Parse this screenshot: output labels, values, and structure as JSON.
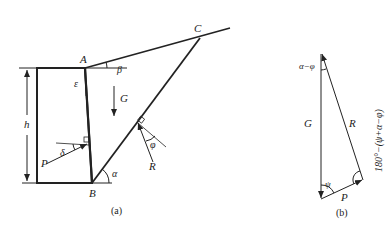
{
  "figure_a": {
    "caption": "(a)",
    "points": {
      "A": "A",
      "B": "B",
      "C": "C"
    },
    "labels": {
      "height": "h",
      "epsilon": "ε",
      "beta": "β",
      "weight": "G",
      "earth_pressure": "P",
      "delta": "δ",
      "reaction": "R",
      "phi": "φ",
      "alpha": "α"
    }
  },
  "figure_b": {
    "caption": "(b)",
    "labels": {
      "weight": "G",
      "reaction": "R",
      "earth_pressure": "P",
      "top_angle": "α−φ",
      "bottom_angle": "ψ",
      "right_angle": "180°−(ψ+α−φ)"
    }
  },
  "colors": {
    "stroke": "#222222",
    "background": "#ffffff"
  }
}
